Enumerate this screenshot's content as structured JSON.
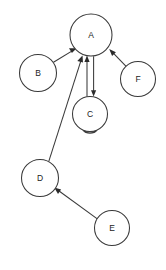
{
  "diagram": {
    "background_color": "#ffffff",
    "node_stroke_color": "#3a3a3a",
    "node_fill_color": "#ffffff",
    "edge_color": "#3a3a3a",
    "label_color": "#222222",
    "canvas": {
      "width": 166,
      "height": 270
    },
    "nodes": [
      {
        "id": "A",
        "label": "A",
        "cx": 91,
        "cy": 35,
        "r": 21
      },
      {
        "id": "B",
        "label": "B",
        "cx": 38,
        "cy": 73,
        "r": 18.5
      },
      {
        "id": "C",
        "label": "C",
        "cx": 90,
        "cy": 114,
        "r": 17.5
      },
      {
        "id": "D",
        "label": "D",
        "cx": 40,
        "cy": 178,
        "r": 18.5
      },
      {
        "id": "E",
        "label": "E",
        "cx": 112,
        "cy": 228,
        "r": 17.5
      },
      {
        "id": "F",
        "label": "F",
        "cx": 138,
        "cy": 79,
        "r": 17.5
      }
    ],
    "edges": [
      {
        "id": "B-A",
        "from": "B",
        "to": "A",
        "directed": true,
        "arrow_at": "A"
      },
      {
        "id": "F-A",
        "from": "F",
        "to": "A",
        "directed": true,
        "arrow_at": "A"
      },
      {
        "id": "D-A",
        "from": "D",
        "to": "A",
        "directed": true,
        "arrow_at": "A"
      },
      {
        "id": "C-A",
        "from": "C",
        "to": "A",
        "directed": true,
        "arrow_at": "A"
      },
      {
        "id": "A-C",
        "from": "A",
        "to": "C",
        "directed": true,
        "arrow_at": "C"
      },
      {
        "id": "E-D",
        "from": "E",
        "to": "D",
        "directed": true,
        "arrow_at": "D"
      },
      {
        "id": "C-C",
        "from": "C",
        "to": "C",
        "directed": true,
        "arrow_at": "C",
        "self_loop": true
      }
    ]
  }
}
